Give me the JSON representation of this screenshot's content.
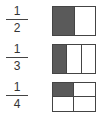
{
  "rows": [
    {
      "fraction": {
        "numerator": "1",
        "denominator": "2"
      },
      "model": {
        "type": "columns",
        "parts": 2,
        "shaded": 1
      }
    },
    {
      "fraction": {
        "numerator": "1",
        "denominator": "3"
      },
      "model": {
        "type": "columns",
        "parts": 3,
        "shaded": 1
      }
    },
    {
      "fraction": {
        "numerator": "1",
        "denominator": "4"
      },
      "model": {
        "type": "grid-2x2",
        "parts": 4,
        "shaded": 1
      }
    }
  ],
  "colors": {
    "shaded": "#5a5a5a",
    "outline": "#444444",
    "unshaded": "#ffffff"
  }
}
